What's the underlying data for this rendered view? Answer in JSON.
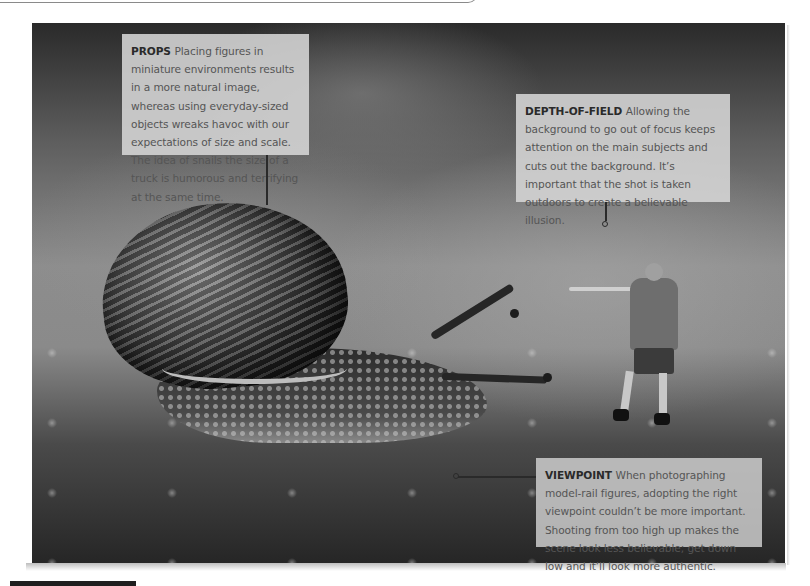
{
  "page": {
    "type": "annotated photograph spread",
    "photo_subject": "Garden snail with miniature model-rail figure of a hunter aiming a rifle"
  },
  "callouts": [
    {
      "id": "props",
      "title": "PROPS",
      "body": "Placing figures in miniature environments results in a more natural image, whereas using everyday-sized objects wreaks havoc with our expectations of size and scale. The idea of snails the size of a truck is humorous and terrifying at the same time."
    },
    {
      "id": "depth-of-field",
      "title": "DEPTH-OF-FIELD",
      "body": "Allowing the background to go out of focus keeps attention on the main subjects and cuts out the background. It’s important that the shot is taken outdoors to create a believable illusion."
    },
    {
      "id": "viewpoint",
      "title": "VIEWPOINT",
      "body": "When photographing model-rail figures, adopting the right viewpoint couldn’t be more important. Shooting from too high up makes the scene look less believable; get down low and it’ll look more authentic."
    }
  ],
  "colors": {
    "callout_bg": "#d6d6d6",
    "callout_title": "#2a2a2a",
    "callout_text": "#555555",
    "connector": "#2a2a2a"
  }
}
